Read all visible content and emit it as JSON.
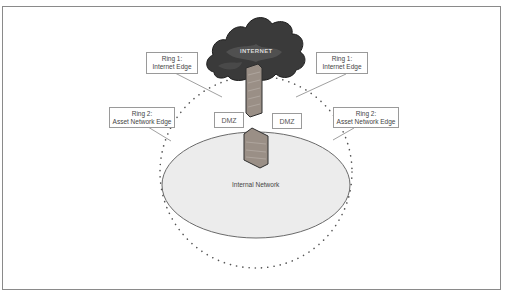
{
  "diagram": {
    "cloud_label": "INTERNET",
    "internal_network_label": "Internal Network",
    "dmz_left": "DMZ",
    "dmz_right": "DMZ",
    "ring1_left": {
      "line1": "Ring 1:",
      "line2": "Internet Edge"
    },
    "ring1_right": {
      "line1": "Ring 1:",
      "line2": "Internet Edge"
    },
    "ring2_left": {
      "line1": "Ring 2:",
      "line2": "Asset Network Edge"
    },
    "ring2_right": {
      "line1": "Ring 2:",
      "line2": "Asset Network Edge"
    },
    "colors": {
      "cloud": "#3a3a3a",
      "firewall": "#9a8f86",
      "internal_network_fill": "#ececec",
      "ring_dots": "#555555",
      "frame": "#8a8a8a"
    }
  }
}
